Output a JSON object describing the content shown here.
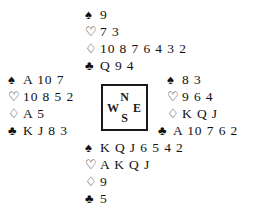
{
  "diagram": {
    "kind": "bridge-deal-diagram",
    "suit_symbols": {
      "spades": "♠",
      "hearts": "♡",
      "diamonds": "♢",
      "clubs": "♣"
    },
    "compass": {
      "north": "N",
      "west": "W",
      "east": "E",
      "south": "S"
    },
    "hands": {
      "north": {
        "spades": "9",
        "hearts": "7 3",
        "diamonds": "10 8 7 6 4 3 2",
        "clubs": "Q 9 4"
      },
      "west": {
        "spades": "A 10 7",
        "hearts": "10 8 5 2",
        "diamonds": "A 5",
        "clubs": "K J 8 3"
      },
      "east": {
        "spades": "8 3",
        "hearts": "9 6 4",
        "diamonds": "K Q J",
        "clubs": "A 10 7 6 2"
      },
      "south": {
        "spades": "K Q J 6 5 4 2",
        "hearts": "A K Q J",
        "diamonds": "9",
        "clubs": "5"
      }
    }
  }
}
